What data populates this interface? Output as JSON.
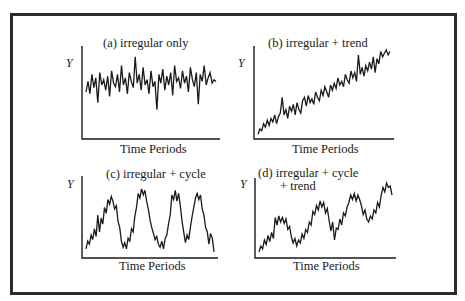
{
  "figure": {
    "frame_color": "#2b2b2b",
    "line_color": "#1a1a1a"
  },
  "chart_data": [
    {
      "type": "line",
      "panel": "a",
      "title": "(a)  irregular only",
      "xlabel": "Time Periods",
      "ylabel": "Y",
      "grid": false,
      "components": [
        "irregular"
      ],
      "series": [
        {
          "name": "irregular only",
          "values": [
            50,
            62,
            48,
            70,
            55,
            66,
            38,
            72,
            58,
            64,
            52,
            68,
            45,
            74,
            60,
            56,
            70,
            50,
            80,
            58,
            66,
            48,
            72,
            62,
            55,
            90,
            60,
            70,
            52,
            78,
            58,
            64,
            48,
            74,
            56,
            62,
            30,
            70,
            60,
            76,
            52,
            68,
            58,
            72,
            46,
            80,
            62,
            66,
            54,
            74,
            60,
            68,
            50,
            78,
            64,
            56,
            72,
            36,
            70,
            62,
            80,
            58,
            66,
            72,
            60,
            64,
            62
          ]
        }
      ]
    },
    {
      "type": "line",
      "panel": "b",
      "title": "(b)  irregular + trend",
      "xlabel": "Time Periods",
      "ylabel": "Y",
      "grid": false,
      "components": [
        "irregular",
        "trend"
      ],
      "series": [
        {
          "name": "irregular + trend",
          "values": [
            2,
            8,
            6,
            14,
            10,
            18,
            12,
            20,
            16,
            24,
            14,
            22,
            26,
            44,
            24,
            30,
            20,
            34,
            28,
            36,
            24,
            38,
            30,
            26,
            40,
            44,
            34,
            46,
            38,
            42,
            36,
            50,
            44,
            40,
            52,
            46,
            56,
            50,
            44,
            58,
            52,
            60,
            54,
            66,
            58,
            62,
            56,
            70,
            64,
            60,
            74,
            66,
            72,
            62,
            92,
            70,
            78,
            68,
            80,
            74,
            84,
            76,
            90,
            72,
            88,
            82,
            96,
            90,
            94,
            98,
            92,
            96
          ]
        }
      ]
    },
    {
      "type": "line",
      "panel": "c",
      "title": "(c)  irregular + cycle",
      "xlabel": "Time Periods",
      "ylabel": "Y",
      "grid": false,
      "components": [
        "irregular",
        "cycle"
      ],
      "series": [
        {
          "name": "irregular + cycle",
          "values": [
            8,
            18,
            14,
            26,
            20,
            34,
            24,
            52,
            30,
            48,
            40,
            62,
            54,
            72,
            66,
            76,
            70,
            60,
            64,
            44,
            36,
            18,
            10,
            16,
            8,
            22,
            18,
            34,
            30,
            50,
            62,
            80,
            74,
            86,
            78,
            84,
            70,
            60,
            46,
            36,
            28,
            20,
            24,
            14,
            10,
            18,
            8,
            22,
            26,
            40,
            52,
            78,
            72,
            84,
            70,
            80,
            64,
            44,
            30,
            16,
            26,
            20,
            36,
            50,
            62,
            74,
            80,
            72,
            78,
            60,
            52,
            36,
            30,
            14,
            28,
            22,
            4
          ]
        }
      ]
    },
    {
      "type": "line",
      "panel": "d",
      "title": "(d)  irregular + cycle\n+ trend",
      "xlabel": "Time Periods",
      "ylabel": "Y",
      "grid": false,
      "components": [
        "irregular",
        "cycle",
        "trend"
      ],
      "series": [
        {
          "name": "irregular + cycle + trend",
          "values": [
            4,
            12,
            8,
            20,
            14,
            26,
            18,
            30,
            22,
            50,
            40,
            52,
            44,
            50,
            42,
            48,
            34,
            38,
            24,
            16,
            22,
            12,
            20,
            16,
            28,
            22,
            34,
            30,
            44,
            40,
            58,
            54,
            66,
            60,
            72,
            64,
            70,
            56,
            62,
            46,
            32,
            44,
            20,
            36,
            34,
            48,
            40,
            56,
            52,
            64,
            70,
            80,
            74,
            82,
            72,
            80,
            74,
            66,
            54,
            60,
            48,
            44,
            52,
            48,
            60,
            56,
            70,
            64,
            80,
            90,
            84,
            96,
            90,
            92,
            80
          ]
        }
      ]
    }
  ]
}
